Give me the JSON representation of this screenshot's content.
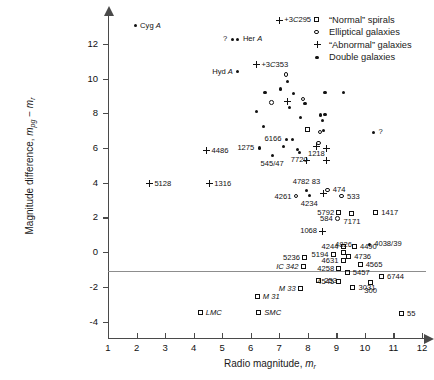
{
  "chart_data": {
    "type": "scatter",
    "title": "",
    "xlabel": "Radio magnitude, m_r",
    "ylabel": "Magnitude difference, m_pg - m_r",
    "xlim": [
      1,
      12
    ],
    "ylim": [
      -4.6,
      13.6
    ],
    "xticks": [
      1,
      2,
      3,
      4,
      5,
      6,
      7,
      8,
      9,
      10,
      11,
      12
    ],
    "yticks": [
      -4,
      -2,
      0,
      2,
      4,
      6,
      8,
      10,
      12
    ],
    "grid": false,
    "zero_reference_line": 0,
    "legend_position": "top-right",
    "legend": [
      {
        "marker": "square",
        "label": "“Normal” spirals"
      },
      {
        "marker": "circle-open",
        "label": "Elliptical galaxies"
      },
      {
        "marker": "plus",
        "label": "“Abnormal” galaxies"
      },
      {
        "marker": "dot",
        "label": "Double galaxies"
      }
    ],
    "series": [
      {
        "name": "Double galaxies",
        "marker": "dot",
        "points": [
          {
            "x": 1.95,
            "y": 13.05,
            "label": "Cyg A",
            "pos": "r"
          },
          {
            "x": 5.35,
            "y": 12.25,
            "label": "? ",
            "pos": "l"
          },
          {
            "x": 5.55,
            "y": 12.25,
            "label": "Her A",
            "pos": "r"
          },
          {
            "x": 5.55,
            "y": 10.4,
            "label": "Hyd A",
            "pos": "l"
          },
          {
            "x": 7.3,
            "y": 9.85,
            "label": "",
            "pos": "r"
          },
          {
            "x": 6.5,
            "y": 9.2,
            "label": "",
            "pos": "r"
          },
          {
            "x": 7.05,
            "y": 9.4,
            "label": "",
            "pos": "r"
          },
          {
            "x": 7.5,
            "y": 9.15,
            "label": "",
            "pos": "r"
          },
          {
            "x": 7.9,
            "y": 8.55,
            "label": "",
            "pos": "r"
          },
          {
            "x": 7.35,
            "y": 8.35,
            "label": "",
            "pos": "r"
          },
          {
            "x": 8.6,
            "y": 9.2,
            "label": "",
            "pos": "r"
          },
          {
            "x": 9.25,
            "y": 9.2,
            "label": "",
            "pos": "r"
          },
          {
            "x": 6.2,
            "y": 8.1,
            "label": "",
            "pos": "r"
          },
          {
            "x": 7.75,
            "y": 7.75,
            "label": "",
            "pos": "r"
          },
          {
            "x": 8.45,
            "y": 7.9,
            "label": "",
            "pos": "r"
          },
          {
            "x": 8.6,
            "y": 7.95,
            "label": "",
            "pos": "r"
          },
          {
            "x": 8.52,
            "y": 7.6,
            "label": "",
            "pos": "r"
          },
          {
            "x": 6.45,
            "y": 7.25,
            "label": "",
            "pos": "r"
          },
          {
            "x": 8.55,
            "y": 7.0,
            "label": "",
            "pos": "r"
          },
          {
            "x": 10.3,
            "y": 6.9,
            "label": "?",
            "pos": "r"
          },
          {
            "x": 7.25,
            "y": 6.5,
            "label": "6166",
            "pos": "l"
          },
          {
            "x": 7.45,
            "y": 6.5,
            "label": "",
            "pos": "r"
          },
          {
            "x": 7.15,
            "y": 6.1,
            "label": "",
            "pos": "r"
          },
          {
            "x": 6.3,
            "y": 6.0,
            "label": "1275",
            "pos": "l"
          },
          {
            "x": 7.65,
            "y": 5.9,
            "label": "",
            "pos": "r"
          },
          {
            "x": 7.7,
            "y": 5.75,
            "label": "7720",
            "pos": "b"
          },
          {
            "x": 6.75,
            "y": 5.55,
            "label": "545/47",
            "pos": "b"
          },
          {
            "x": 8.05,
            "y": 3.25,
            "label": "4234",
            "pos": "b"
          },
          {
            "x": 7.95,
            "y": 3.55,
            "label": "4782 83",
            "pos": "t"
          },
          {
            "x": 10.15,
            "y": 0.45,
            "label": "4038/39",
            "pos": "r"
          }
        ]
      },
      {
        "name": "Elliptical galaxies",
        "marker": "circle-open",
        "points": [
          {
            "x": 7.25,
            "y": 10.2,
            "label": "",
            "pos": "r"
          },
          {
            "x": 6.75,
            "y": 8.6,
            "label": "",
            "pos": "r"
          },
          {
            "x": 7.85,
            "y": 8.8,
            "label": "",
            "pos": "r"
          },
          {
            "x": 8.45,
            "y": 6.9,
            "label": "",
            "pos": "r"
          },
          {
            "x": 8.4,
            "y": 6.25,
            "label": "",
            "pos": "r"
          },
          {
            "x": 7.6,
            "y": 3.2,
            "label": "4261",
            "pos": "l"
          },
          {
            "x": 8.7,
            "y": 3.55,
            "label": "474",
            "pos": "r"
          },
          {
            "x": 9.2,
            "y": 3.2,
            "label": "533",
            "pos": "r"
          },
          {
            "x": 9.05,
            "y": 1.9,
            "label": "584",
            "pos": "l"
          }
        ]
      },
      {
        "name": "“Abnormal” galaxies",
        "marker": "plus",
        "points": [
          {
            "x": 7.0,
            "y": 13.35,
            "label": "3C 295",
            "pos": "r"
          },
          {
            "x": 6.2,
            "y": 10.8,
            "label": "3C 353",
            "pos": "r"
          },
          {
            "x": 7.3,
            "y": 8.65,
            "label": "",
            "pos": "r"
          },
          {
            "x": 4.45,
            "y": 5.85,
            "label": "4486",
            "pos": "r"
          },
          {
            "x": 8.3,
            "y": 6.1,
            "label": "1218",
            "pos": "b"
          },
          {
            "x": 8.65,
            "y": 5.95,
            "label": "",
            "pos": "r"
          },
          {
            "x": 7.95,
            "y": 5.3,
            "label": "",
            "pos": "r"
          },
          {
            "x": 8.65,
            "y": 5.3,
            "label": "",
            "pos": "r"
          },
          {
            "x": 4.55,
            "y": 3.95,
            "label": "1316",
            "pos": "r"
          },
          {
            "x": 2.45,
            "y": 3.95,
            "label": "5128",
            "pos": "r"
          },
          {
            "x": 8.55,
            "y": 3.4,
            "label": "",
            "pos": "r"
          },
          {
            "x": 8.5,
            "y": 1.2,
            "label": "1068",
            "pos": "l"
          }
        ]
      },
      {
        "name": "“Normal” spirals",
        "marker": "square",
        "points": [
          {
            "x": 8.0,
            "y": 7.05,
            "label": "",
            "pos": "r"
          },
          {
            "x": 9.1,
            "y": 2.25,
            "label": "5792",
            "pos": "l"
          },
          {
            "x": 9.55,
            "y": 2.2,
            "label": "7171",
            "pos": "b"
          },
          {
            "x": 10.4,
            "y": 2.25,
            "label": "1417",
            "pos": "r"
          },
          {
            "x": 9.25,
            "y": 0.28,
            "label": "4244",
            "pos": "l"
          },
          {
            "x": 9.65,
            "y": 0.28,
            "label": "4490",
            "pos": "r"
          },
          {
            "x": 8.9,
            "y": -0.18,
            "label": "5194",
            "pos": "l"
          },
          {
            "x": 9.25,
            "y": -0.05,
            "label": "4826",
            "pos": "t"
          },
          {
            "x": 9.45,
            "y": -0.3,
            "label": "4736",
            "pos": "r"
          },
          {
            "x": 9.25,
            "y": -0.5,
            "label": "4631",
            "pos": "l"
          },
          {
            "x": 9.85,
            "y": -0.75,
            "label": "4565",
            "pos": "r"
          },
          {
            "x": 9.1,
            "y": -0.95,
            "label": "4258",
            "pos": "l"
          },
          {
            "x": 9.4,
            "y": -1.2,
            "label": "5457",
            "pos": "r"
          },
          {
            "x": 7.9,
            "y": -0.35,
            "label": "5236",
            "pos": "l"
          },
          {
            "x": 7.85,
            "y": -0.85,
            "label": "IC 342",
            "pos": "l"
          },
          {
            "x": 8.4,
            "y": -1.65,
            "label": "253",
            "pos": "r"
          },
          {
            "x": 9.1,
            "y": -1.7,
            "label": "4545",
            "pos": "l"
          },
          {
            "x": 9.6,
            "y": -2.05,
            "label": "3031",
            "pos": "r"
          },
          {
            "x": 10.2,
            "y": -1.8,
            "label": "300",
            "pos": "b"
          },
          {
            "x": 10.6,
            "y": -1.45,
            "label": "6744",
            "pos": "r"
          },
          {
            "x": 7.75,
            "y": -2.15,
            "label": "M 33",
            "pos": "l"
          },
          {
            "x": 6.25,
            "y": -2.6,
            "label": "M 31",
            "pos": "r"
          },
          {
            "x": 6.3,
            "y": -3.5,
            "label": "SMC",
            "pos": "r"
          },
          {
            "x": 4.25,
            "y": -3.5,
            "label": "LMC",
            "pos": "r"
          },
          {
            "x": 11.3,
            "y": -3.55,
            "label": "55",
            "pos": "r"
          }
        ]
      }
    ]
  }
}
